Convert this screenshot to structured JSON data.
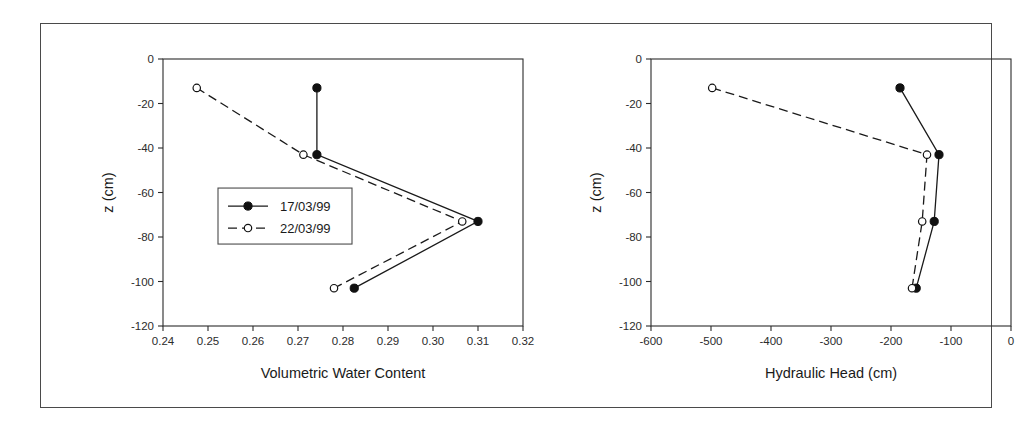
{
  "figure": {
    "border_color": "#4a4a4a",
    "background": "#ffffff",
    "panels": [
      "left",
      "right"
    ]
  },
  "legend": {
    "position": "inside-left-panel",
    "entries": [
      {
        "label": "17/03/99",
        "marker": "filled-circle",
        "line": "solid"
      },
      {
        "label": "22/03/99",
        "marker": "open-circle",
        "line": "dashed"
      }
    ]
  },
  "chart_data": [
    {
      "type": "line",
      "panel": "left",
      "title": "",
      "xlabel": "Volumetric Water Content",
      "ylabel": "z (cm)",
      "xlim": [
        0.24,
        0.32
      ],
      "ylim": [
        -120,
        0
      ],
      "xticks": [
        0.24,
        0.25,
        0.26,
        0.27,
        0.28,
        0.29,
        0.3,
        0.31,
        0.32
      ],
      "xtick_labels": [
        "0.24",
        "0.25",
        "0.26",
        "0.27",
        "0.28",
        "0.29",
        "0.30",
        "0.31",
        "0.32"
      ],
      "yticks": [
        0,
        -20,
        -40,
        -60,
        -80,
        -100,
        -120
      ],
      "ytick_labels": [
        "0",
        "-20",
        "-40",
        "-60",
        "-80",
        "-100",
        "-120"
      ],
      "grid": false,
      "legend": true,
      "legend_position": "center-left",
      "series": [
        {
          "name": "17/03/99",
          "marker": "filled-circle",
          "line": "solid",
          "x": [
            0.2742,
            0.2742,
            0.31,
            0.2825
          ],
          "y": [
            -13,
            -43,
            -73,
            -103
          ]
        },
        {
          "name": "22/03/99",
          "marker": "open-circle",
          "line": "dashed",
          "x": [
            0.2475,
            0.2712,
            0.3065,
            0.278
          ],
          "y": [
            -13,
            -43,
            -73,
            -103
          ]
        }
      ]
    },
    {
      "type": "line",
      "panel": "right",
      "title": "",
      "xlabel": "Hydraulic Head (cm)",
      "ylabel": "z (cm)",
      "xlim": [
        -600,
        0
      ],
      "ylim": [
        -120,
        0
      ],
      "xticks": [
        -600,
        -500,
        -400,
        -300,
        -200,
        -100,
        0
      ],
      "xtick_labels": [
        "-600",
        "-500",
        "-400",
        "-300",
        "-200",
        "-100",
        "0"
      ],
      "yticks": [
        0,
        -20,
        -40,
        -60,
        -80,
        -100,
        -120
      ],
      "ytick_labels": [
        "0",
        "-20",
        "-40",
        "-60",
        "-80",
        "-100",
        "-120"
      ],
      "grid": false,
      "legend": false,
      "series": [
        {
          "name": "17/03/99",
          "marker": "filled-circle",
          "line": "solid",
          "x": [
            -185,
            -120,
            -128,
            -158
          ],
          "y": [
            -13,
            -43,
            -73,
            -103
          ]
        },
        {
          "name": "22/03/99",
          "marker": "open-circle",
          "line": "dashed",
          "x": [
            -498,
            -140,
            -148,
            -165
          ],
          "y": [
            -13,
            -43,
            -73,
            -103
          ]
        }
      ]
    }
  ]
}
